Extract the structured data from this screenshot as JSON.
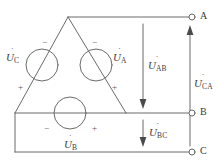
{
  "figure": {
    "type": "schematic",
    "stroke_color": "#6b6b6b",
    "text_color": "#434343",
    "background": "#ffffff"
  },
  "sources": [
    {
      "id": "source-a",
      "label_base": "U",
      "label_sub": "A",
      "overdot": "˙",
      "label_text": "U̇A",
      "neg_sign": "−",
      "pos_sign": "+",
      "neg_position": "top-left",
      "pos_position": "bottom-right"
    },
    {
      "id": "source-b",
      "label_base": "U",
      "label_sub": "B",
      "overdot": "˙",
      "label_text": "U̇B",
      "neg_sign": "−",
      "pos_sign": "+",
      "neg_position": "left",
      "pos_position": "right"
    },
    {
      "id": "source-c",
      "label_base": "U",
      "label_sub": "C",
      "overdot": "˙",
      "label_text": "U̇C",
      "neg_sign": "−",
      "pos_sign": "+",
      "neg_position": "top-right",
      "pos_position": "bottom-left"
    }
  ],
  "line_voltages": [
    {
      "id": "voltage-ab",
      "label_base": "U",
      "label_sub": "AB",
      "overdot": "˙",
      "label_text": "U̇AB",
      "arrow_direction": "down"
    },
    {
      "id": "voltage-bc",
      "label_base": "U",
      "label_sub": "BC",
      "overdot": "˙",
      "label_text": "U̇BC",
      "arrow_direction": "down"
    },
    {
      "id": "voltage-ca",
      "label_base": "U",
      "label_sub": "CA",
      "overdot": "˙",
      "label_text": "U̇CA",
      "arrow_direction": "up"
    }
  ],
  "terminals": [
    {
      "id": "terminal-a",
      "label": "A"
    },
    {
      "id": "terminal-b",
      "label": "B"
    },
    {
      "id": "terminal-c",
      "label": "C"
    }
  ]
}
